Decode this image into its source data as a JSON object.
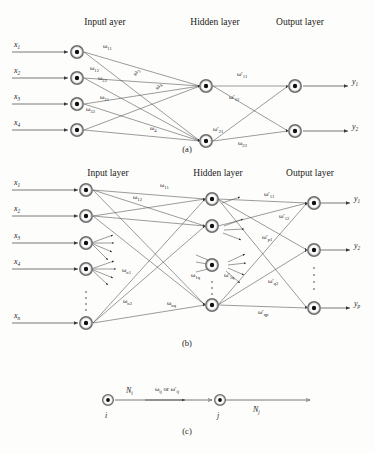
{
  "figure": {
    "panels": [
      {
        "id": "a",
        "caption": "(a)",
        "layer_titles": {
          "input": "Inputl ayer",
          "hidden": "Hidden layer",
          "output": "Output layer"
        },
        "inputs": [
          {
            "base": "x",
            "sub": "1"
          },
          {
            "base": "x",
            "sub": "2"
          },
          {
            "base": "x",
            "sub": "3"
          },
          {
            "base": "x",
            "sub": "4"
          }
        ],
        "outputs": [
          {
            "base": "y",
            "sub": "1"
          },
          {
            "base": "y",
            "sub": "2"
          }
        ],
        "hidden_count": 2,
        "input_weights": [
          {
            "sym": "ω",
            "prime": "",
            "sub": "11"
          },
          {
            "sym": "ω",
            "prime": "",
            "sub": "12"
          },
          {
            "sym": "ω",
            "prime": "",
            "sub": "22"
          },
          {
            "sym": "ω",
            "prime": "",
            "sub": "31"
          },
          {
            "sym": "ω",
            "prime": "",
            "sub": "32"
          },
          {
            "sym": "ω",
            "prime": "",
            "sub": "3"
          },
          {
            "sym": "ω",
            "prime": "",
            "sub": "4"
          },
          {
            "sym": "ω",
            "prime": "",
            "sub": "4"
          }
        ],
        "output_weights": [
          {
            "sym": "ω",
            "prime": "′",
            "sub": "11"
          },
          {
            "sym": "ω",
            "prime": "′",
            "sub": "12"
          },
          {
            "sym": "ω",
            "prime": "′",
            "sub": "21"
          },
          {
            "sym": "ω",
            "prime": "",
            "sub": "22"
          }
        ]
      },
      {
        "id": "b",
        "caption": "(b)",
        "layer_titles": {
          "input": "Input layer",
          "hidden": "Hidden layer",
          "output": "Output layer"
        },
        "inputs": [
          {
            "base": "x",
            "sub": "1"
          },
          {
            "base": "x",
            "sub": "2"
          },
          {
            "base": "x",
            "sub": "3"
          },
          {
            "base": "x",
            "sub": "4"
          },
          {
            "base": "x",
            "sub": "n"
          }
        ],
        "outputs": [
          {
            "base": "y",
            "sub": "1"
          },
          {
            "base": "y",
            "sub": "2"
          },
          {
            "base": "y",
            "sub": "p"
          }
        ],
        "input_weights": [
          {
            "sym": "ω",
            "prime": "",
            "sub": "11"
          },
          {
            "sym": "ω",
            "prime": "",
            "sub": "12"
          },
          {
            "sym": "ω",
            "prime": "",
            "sub": "n1"
          },
          {
            "sym": "ω",
            "prime": "",
            "sub": "n2"
          },
          {
            "sym": "ω",
            "prime": "",
            "sub": "nq"
          },
          {
            "sym": "ω",
            "prime": "",
            "sub": "1q"
          }
        ],
        "output_weights": [
          {
            "sym": "ω",
            "prime": "′",
            "sub": "11"
          },
          {
            "sym": "ω",
            "prime": "′",
            "sub": "12"
          },
          {
            "sym": "ω",
            "prime": "′",
            "sub": "p1"
          },
          {
            "sym": "ω",
            "prime": "′",
            "sub": "q2"
          },
          {
            "sym": "ω",
            "prime": "′",
            "sub": "qp"
          },
          {
            "sym": "ω",
            "prime": "′",
            "sub": "1q"
          }
        ]
      },
      {
        "id": "c",
        "caption": "(c)",
        "node_i_label": {
          "base": "i"
        },
        "node_j_label": {
          "base": "j"
        },
        "signal_in": {
          "base": "N",
          "sub": "i"
        },
        "signal_out": {
          "base": "N",
          "sub": "j"
        },
        "edge_label": {
          "left": "ω",
          "left_sub": "ij",
          "conj": "or",
          "right": "ω",
          "right_prime": "′",
          "right_sub": "ij"
        }
      }
    ]
  },
  "style": {
    "background": "#fdfdfb",
    "line_color": "#4a4a4a",
    "node_ring": "#9a9a9a",
    "node_core": "#111111",
    "text_color": "#1a1a1a"
  }
}
